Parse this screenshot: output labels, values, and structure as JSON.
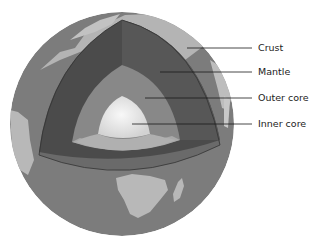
{
  "diagram": {
    "labels": [
      {
        "id": "crust",
        "text": "Crust"
      },
      {
        "id": "mantle",
        "text": "Mantle"
      },
      {
        "id": "outer_core",
        "text": "Outer core"
      },
      {
        "id": "inner_core",
        "text": "Inner core"
      }
    ],
    "colors": {
      "ocean": "#7a7a7a",
      "land": "#b9b9b9",
      "crust_band": "#6e6e6e",
      "mantle": "#4a4a4a",
      "outer_core": "#8c8c8c",
      "inner_core": "#e6e6e6",
      "leader_line": "#1a1a1a"
    }
  }
}
